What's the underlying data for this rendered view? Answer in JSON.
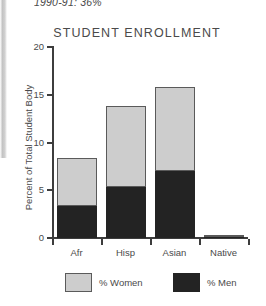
{
  "page_header": "1990-91: 36%",
  "chart_data": {
    "type": "bar",
    "subtype": "stacked-vertical",
    "title": "STUDENT ENROLLMENT",
    "xlabel": "",
    "ylabel": "Percent of Total Student Body",
    "categories": [
      "Afr",
      "Hisp",
      "Asian",
      "Native"
    ],
    "series": [
      {
        "name": "% Men",
        "color": "#232323",
        "values": [
          3.3,
          5.3,
          7.0,
          0.2
        ]
      },
      {
        "name": "% Women",
        "color": "#cdcdcd",
        "values": [
          5.1,
          8.5,
          8.8,
          0.1
        ]
      }
    ],
    "totals": [
      8.4,
      13.8,
      15.8,
      0.3
    ],
    "ylim": [
      0,
      20
    ],
    "yticks": [
      20,
      15,
      10,
      5,
      0
    ],
    "ytick_labels": [
      "20",
      "15",
      "10",
      "5",
      "0"
    ],
    "grid": false,
    "legend_position": "bottom",
    "legend": [
      "% Women",
      "% Men"
    ]
  },
  "axes": {
    "y_title": "Percent of Total Student Body"
  },
  "colors": {
    "women": "#cdcdcd",
    "men": "#232323",
    "axis": "#3d3d3d",
    "text": "#4a4a4a"
  }
}
